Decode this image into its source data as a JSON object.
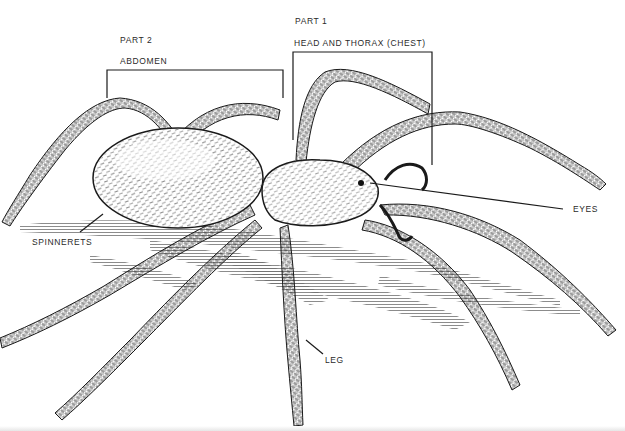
{
  "diagram": {
    "labels": {
      "part1": "PART 1",
      "part1_name": "HEAD AND THORAX (CHEST)",
      "part2": "PART 2",
      "part2_name": "ABDOMEN",
      "spinnerets": "SPINNERETS",
      "eyes": "EYES",
      "leg": "LEG"
    },
    "colors": {
      "ink": "#1a1a1a",
      "label_text": "#2a2a2a",
      "shading": "#555555",
      "background": "#ffffff"
    }
  }
}
